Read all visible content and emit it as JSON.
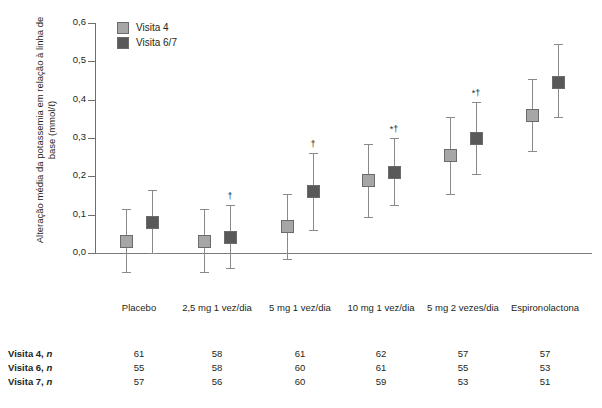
{
  "chart_data": {
    "type": "scatter",
    "title": "",
    "xlabel": "",
    "ylabel": "Alteração média da potassemia em relação à linha de base (mmol/ℓ)",
    "ylim": [
      0.0,
      0.6
    ],
    "yticks": [
      "0,0",
      "0,1",
      "0,2",
      "0,3",
      "0,4",
      "0,5",
      "0,6"
    ],
    "grid": false,
    "legend_position": "top-left",
    "categories": [
      "Placebo",
      "2,5 mg 1 vez/dia",
      "5 mg 1 vez/dia",
      "10 mg 1 vez/dia",
      "5 mg 2 vezes/dia",
      "Espironolactona"
    ],
    "group_bracket_label": "Finerenona",
    "series": [
      {
        "name": "Visita 4",
        "color": "#a6a6a6",
        "values": [
          0.03,
          0.03,
          0.07,
          0.19,
          0.255,
          0.36
        ],
        "err_low": [
          -0.05,
          -0.05,
          -0.015,
          0.095,
          0.155,
          0.265
        ],
        "err_high": [
          0.115,
          0.115,
          0.155,
          0.285,
          0.355,
          0.455
        ],
        "sig": [
          "",
          "",
          "",
          "",
          "",
          ""
        ]
      },
      {
        "name": "Visita 6/7",
        "color": "#595959",
        "values": [
          0.08,
          0.04,
          0.16,
          0.21,
          0.3,
          0.445
        ],
        "err_low": [
          0.0,
          -0.04,
          0.06,
          0.125,
          0.205,
          0.355
        ],
        "err_high": [
          0.165,
          0.125,
          0.26,
          0.3,
          0.395,
          0.545
        ],
        "sig": [
          "",
          "†",
          "†",
          "*†",
          "*†",
          ""
        ]
      }
    ]
  },
  "legend": {
    "items": [
      {
        "label": "Visita 4",
        "color": "#a6a6a6"
      },
      {
        "label": "Visita 6/7",
        "color": "#595959"
      }
    ]
  },
  "axis": {
    "y_title": "Alteração média da potassemia em relação à linha de base (mmol/ℓ)",
    "y_labels": [
      "0,6",
      "0,5",
      "0,4",
      "0,3",
      "0,2",
      "0,1",
      "0,0"
    ]
  },
  "table": {
    "column_headers": [
      "Placebo",
      "2,5 mg 1 vez/dia",
      "5 mg 1 vez/dia",
      "10 mg 1 vez/dia",
      "5 mg 2 vezes/dia",
      "Espironolactona"
    ],
    "bracket_label": "Finerenona",
    "rows": [
      {
        "label": "Visita 4,",
        "label_italic": "n",
        "values": [
          "61",
          "58",
          "61",
          "62",
          "57",
          "57"
        ]
      },
      {
        "label": "Visita 6,",
        "label_italic": "n",
        "values": [
          "55",
          "58",
          "60",
          "61",
          "55",
          "53"
        ]
      },
      {
        "label": "Visita 7,",
        "label_italic": "n",
        "values": [
          "57",
          "56",
          "60",
          "59",
          "53",
          "51"
        ]
      }
    ]
  }
}
